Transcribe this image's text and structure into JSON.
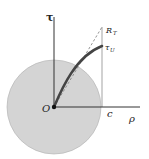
{
  "diagram": {
    "labels": {
      "tau": "τ",
      "rho": "ρ",
      "origin": "O",
      "c": "c",
      "r_t": "R",
      "r_t_sub": "T",
      "tau_u": "τ",
      "tau_u_sub": "U"
    },
    "colors": {
      "disk_fill": "#d4d4d4",
      "disk_stroke": "#b0b0b0",
      "axis": "#333333",
      "curve": "#444444",
      "guide": "#999999"
    }
  }
}
